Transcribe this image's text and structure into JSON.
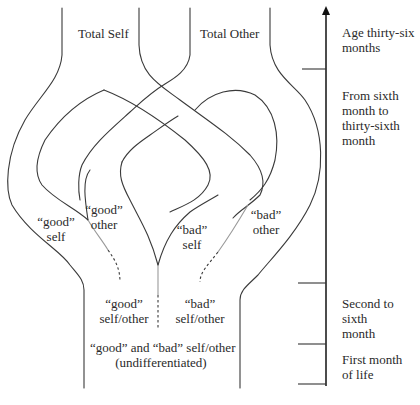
{
  "diagram": {
    "columns": {
      "total_self": "Total Self",
      "total_other": "Total Other"
    },
    "strands": {
      "good_self": [
        "“good”",
        "self"
      ],
      "good_other": [
        "“good”",
        "other"
      ],
      "bad_self": [
        "“bad”",
        "self"
      ],
      "bad_other": [
        "“bad”",
        "other"
      ]
    },
    "stage2": {
      "good_self_other": [
        "“good”",
        "self/other"
      ],
      "bad_self_other": [
        "“bad”",
        "self/other"
      ]
    },
    "stage1": {
      "undifferentiated": [
        "“good” and “bad” self/other",
        "(undifferentiated)"
      ]
    },
    "age_axis": {
      "labels": [
        {
          "id": "age-36",
          "lines": [
            "Age thirty-six",
            "months"
          ]
        },
        {
          "id": "sixth-to-36th",
          "lines": [
            "From sixth",
            "month to",
            "thirty-sixth",
            "month"
          ]
        },
        {
          "id": "second-to-sixth",
          "lines": [
            "Second to sixth",
            "month"
          ]
        },
        {
          "id": "first-month",
          "lines": [
            "First month",
            "of life"
          ]
        }
      ]
    }
  }
}
